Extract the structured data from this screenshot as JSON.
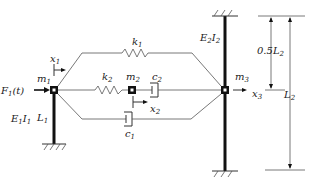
{
  "diagram": {
    "labels": {
      "force": {
        "main": "F",
        "sub": "1",
        "suffix": "(t)"
      },
      "m1": {
        "main": "m",
        "sub": "1"
      },
      "m2": {
        "main": "m",
        "sub": "2"
      },
      "m3": {
        "main": "m",
        "sub": "3"
      },
      "k1": {
        "main": "k",
        "sub": "1"
      },
      "k2": {
        "main": "k",
        "sub": "2"
      },
      "c1": {
        "main": "c",
        "sub": "1"
      },
      "c2": {
        "main": "c",
        "sub": "2"
      },
      "x1": {
        "main": "x",
        "sub": "1"
      },
      "x2": {
        "main": "x",
        "sub": "2"
      },
      "x3": {
        "main": "x",
        "sub": "3"
      },
      "E1I1": {
        "a": "E",
        "as": "1",
        "b": "I",
        "bs": "1"
      },
      "E2I2": {
        "a": "E",
        "as": "2",
        "b": "I",
        "bs": "2"
      },
      "L1": {
        "main": "L",
        "sub": "1"
      },
      "L2": {
        "main": "L",
        "sub": "2"
      },
      "half_L2": {
        "main": "0.5L",
        "sub": "2"
      }
    }
  }
}
